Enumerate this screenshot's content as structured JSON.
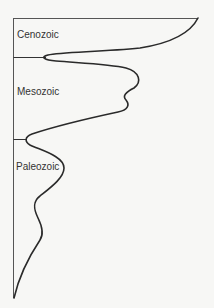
{
  "diagram": {
    "type": "spindle-diagram",
    "eras": [
      {
        "label": "Cenozoic"
      },
      {
        "label": "Mesozoic"
      },
      {
        "label": "Paleozoic"
      }
    ],
    "colors": {
      "axis": "#555555",
      "curve": "#2a2a2a",
      "label": "#333333",
      "background": "#f7f7f5"
    }
  }
}
